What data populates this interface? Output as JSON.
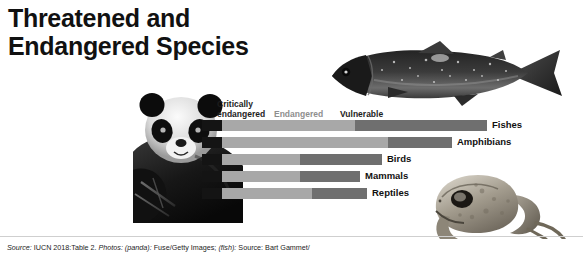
{
  "title": "Threatened and\nEndangered Species",
  "legend": {
    "critically_endangered": "Critically\nendangered",
    "endangered": "Endangered",
    "vulnerable": "Vulnerable",
    "colors": {
      "critically_endangered": "#a8a8a8",
      "endangered": "#c9c9c9",
      "vulnerable": "#6f6f6f",
      "tip": "#141414"
    }
  },
  "photos": {
    "panda": "panda-photo",
    "fish": "fish-photo",
    "toad": "toad-photo"
  },
  "footer": {
    "source_label": "Source:",
    "source_text": " IUCN 2018:Table 2. ",
    "photos_label": "Photos:",
    "panda_credit_key": " (panda):",
    "panda_credit_value": " Fuse/Getty Images; ",
    "fish_credit_key": "(fish):",
    "fish_credit_value": " Source: Bart Gammet/",
    "full": "Source: IUCN 2018:Table 2. Photos: (panda): Fuse/Getty Images; (fish): Source: Bart Gammet/"
  },
  "chart_data": {
    "type": "bar",
    "orientation": "horizontal",
    "stacked": true,
    "title": "Threatened and Endangered Species",
    "xlabel": "",
    "ylabel": "",
    "grid": false,
    "legend_position": "top",
    "categories": [
      "Fishes",
      "Amphibians",
      "Birds",
      "Mammals",
      "Reptiles"
    ],
    "series": [
      {
        "name": "Critically endangered",
        "color": "#a8a8a8",
        "values": [
          133,
          166,
          78,
          78,
          90
        ]
      },
      {
        "name": "Endangered",
        "color": "#c9c9c9",
        "values": [
          0,
          0,
          0,
          0,
          0
        ]
      },
      {
        "name": "Vulnerable",
        "color": "#6f6f6f",
        "values": [
          132,
          64,
          82,
          60,
          55
        ]
      }
    ],
    "totals": [
      265,
      230,
      160,
      138,
      145
    ],
    "units": "pixels",
    "note": "Bar segment widths measured from the chart; bars share a common left baseline."
  },
  "bars": [
    {
      "label": "Fishes",
      "start": 222,
      "split": 355,
      "end": 487,
      "top": 0,
      "label_x": 492
    },
    {
      "label": "Amphibians",
      "start": 222,
      "split": 388,
      "end": 452,
      "top": 17,
      "label_x": 457
    },
    {
      "label": "Birds",
      "start": 222,
      "split": 300,
      "end": 382,
      "top": 34,
      "label_x": 387
    },
    {
      "label": "Mammals",
      "start": 222,
      "split": 300,
      "end": 360,
      "top": 51,
      "label_x": 365
    },
    {
      "label": "Reptiles",
      "start": 222,
      "split": 312,
      "end": 367,
      "top": 68,
      "label_x": 372
    }
  ]
}
